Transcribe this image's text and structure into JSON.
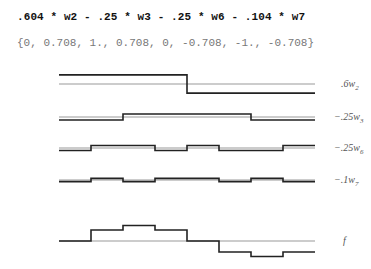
{
  "header": {
    "expression": ".604 * w2 - .25 * w3 - .25 * w6 - .104 * w7",
    "values": "{0, 0.708, 1., 0.708, 0, -0.708, -1., -0.708}"
  },
  "colors": {
    "signal": "#222222",
    "baseline": "#999999"
  },
  "chart_data": {
    "type": "line",
    "title": ".604 * w2 - .25 * w3 - .25 * w6 - .104 * w7",
    "subtitle": "{0, 0.708, 1., 0.708, 0, -0.708, -1., -0.708}",
    "x": [
      0,
      1,
      2,
      3,
      4,
      5,
      6,
      7
    ],
    "series": [
      {
        "name": ".6w2",
        "label_main": ".6w",
        "label_sub": "2",
        "values": [
          0.302,
          0.302,
          0.302,
          0.302,
          -0.302,
          -0.302,
          -0.302,
          -0.302
        ]
      },
      {
        "name": "-.25w3",
        "label_main": "−.25w",
        "label_sub": "3",
        "values": [
          -0.125,
          -0.125,
          0.125,
          0.125,
          0.125,
          0.125,
          -0.125,
          -0.125
        ]
      },
      {
        "name": "-.25w6",
        "label_main": "−.25w",
        "label_sub": "6",
        "values": [
          -0.125,
          0.125,
          0.125,
          -0.125,
          0.125,
          -0.125,
          -0.125,
          0.125
        ]
      },
      {
        "name": "-.1w7",
        "label_main": "−.1w",
        "label_sub": "7",
        "values": [
          -0.052,
          0.052,
          -0.052,
          0.052,
          0.052,
          -0.052,
          0.052,
          -0.052
        ]
      },
      {
        "name": "f",
        "label_main": "f",
        "label_sub": "",
        "values": [
          0,
          0.708,
          1.0,
          0.708,
          0,
          -0.708,
          -1.0,
          -0.708
        ]
      }
    ],
    "xlabel": "",
    "ylabel": "",
    "grid": false,
    "legend": "right-labels",
    "style": "step"
  }
}
